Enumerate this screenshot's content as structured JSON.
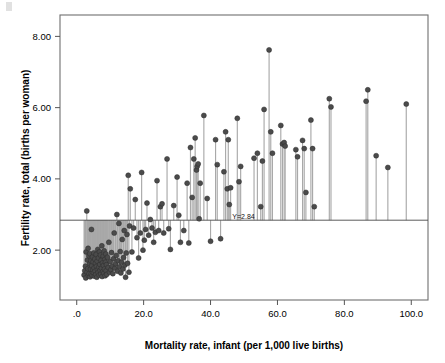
{
  "chart_data": {
    "type": "scatter",
    "title": "",
    "subtitle": "",
    "xlabel": "Mortality rate, infant (per 1,000 live births)",
    "ylabel": "Fertility rate, total (births per woman)",
    "xlim": [
      -5.0,
      105.0
    ],
    "ylim": [
      0.6,
      8.6
    ],
    "xticks": [
      0,
      20,
      40,
      60,
      80,
      100
    ],
    "xticklabels": [
      ".0",
      "20.0",
      "40.0",
      "60.0",
      "80.0",
      "100.0"
    ],
    "yticks": [
      2,
      4,
      6,
      8
    ],
    "yticklabels": [
      "2.00",
      "4.00",
      "6.00",
      "8.00"
    ],
    "grid": false,
    "legend": null,
    "legend_position": "none",
    "marker_style": "filled-circle",
    "marker_color": "#4b4b4b",
    "dropline_color": "#a9a9a9",
    "frame_color": "#6f6f6f",
    "annotations": [
      {
        "name": "reference-line-label",
        "text": "Y=2.84",
        "x": 46.5,
        "y": 2.84
      }
    ],
    "reference_lines": [
      {
        "name": "mean-fertility-reference-line",
        "orientation": "horizontal",
        "value": 2.84,
        "label": "Y=2.84"
      }
    ],
    "droplines_to": 2.84,
    "n_points": 189,
    "points": [
      [
        2.2,
        1.3
      ],
      [
        2.4,
        1.42
      ],
      [
        2.6,
        1.55
      ],
      [
        2.7,
        1.22
      ],
      [
        2.8,
        1.95
      ],
      [
        3.0,
        3.1
      ],
      [
        3.1,
        1.38
      ],
      [
        3.2,
        1.72
      ],
      [
        3.3,
        1.48
      ],
      [
        3.4,
        2.05
      ],
      [
        3.5,
        1.28
      ],
      [
        3.6,
        1.84
      ],
      [
        3.7,
        1.34
      ],
      [
        3.8,
        1.62
      ],
      [
        3.9,
        1.9
      ],
      [
        4.0,
        1.25
      ],
      [
        4.1,
        1.47
      ],
      [
        4.2,
        1.7
      ],
      [
        4.3,
        1.33
      ],
      [
        4.4,
        2.58
      ],
      [
        4.5,
        1.56
      ],
      [
        4.6,
        1.29
      ],
      [
        4.7,
        1.81
      ],
      [
        4.8,
        1.44
      ],
      [
        4.9,
        1.67
      ],
      [
        5.0,
        1.36
      ],
      [
        5.1,
        1.92
      ],
      [
        5.2,
        1.5
      ],
      [
        5.3,
        1.27
      ],
      [
        5.4,
        1.75
      ],
      [
        5.5,
        1.41
      ],
      [
        5.6,
        1.63
      ],
      [
        5.7,
        1.31
      ],
      [
        5.8,
        1.88
      ],
      [
        5.9,
        1.54
      ],
      [
        6.0,
        1.24
      ],
      [
        6.1,
        1.69
      ],
      [
        6.2,
        1.45
      ],
      [
        6.3,
        2.02
      ],
      [
        6.4,
        1.37
      ],
      [
        6.5,
        1.78
      ],
      [
        6.6,
        1.52
      ],
      [
        6.7,
        1.3
      ],
      [
        6.8,
        1.95
      ],
      [
        6.9,
        1.6
      ],
      [
        7.0,
        1.43
      ],
      [
        7.1,
        1.86
      ],
      [
        7.2,
        1.33
      ],
      [
        7.3,
        1.71
      ],
      [
        7.4,
        1.49
      ],
      [
        7.5,
        2.12
      ],
      [
        7.6,
        1.26
      ],
      [
        7.7,
        1.64
      ],
      [
        7.8,
        1.4
      ],
      [
        7.9,
        1.83
      ],
      [
        8.0,
        1.57
      ],
      [
        8.1,
        1.35
      ],
      [
        8.2,
        1.98
      ],
      [
        8.3,
        1.47
      ],
      [
        8.4,
        1.74
      ],
      [
        8.5,
        1.28
      ],
      [
        8.6,
        1.66
      ],
      [
        8.7,
        1.89
      ],
      [
        8.8,
        1.42
      ],
      [
        8.9,
        1.59
      ],
      [
        9.0,
        1.32
      ],
      [
        9.2,
        1.8
      ],
      [
        9.4,
        1.51
      ],
      [
        9.6,
        2.22
      ],
      [
        9.8,
        1.38
      ],
      [
        10.0,
        1.68
      ],
      [
        10.2,
        1.45
      ],
      [
        10.4,
        1.93
      ],
      [
        10.6,
        1.55
      ],
      [
        10.8,
        1.34
      ],
      [
        11.0,
        1.76
      ],
      [
        11.2,
        2.48
      ],
      [
        11.4,
        1.49
      ],
      [
        11.6,
        1.62
      ],
      [
        11.8,
        1.85
      ],
      [
        12.0,
        3.0
      ],
      [
        12.2,
        1.41
      ],
      [
        12.4,
        1.7
      ],
      [
        12.6,
        2.75
      ],
      [
        12.8,
        1.53
      ],
      [
        13.0,
        1.96
      ],
      [
        13.2,
        1.36
      ],
      [
        13.4,
        1.66
      ],
      [
        13.6,
        2.3
      ],
      [
        13.8,
        1.47
      ],
      [
        14.0,
        1.79
      ],
      [
        14.2,
        2.55
      ],
      [
        14.4,
        1.58
      ],
      [
        14.6,
        1.24
      ],
      [
        14.8,
        1.92
      ],
      [
        15.0,
        2.44
      ],
      [
        15.2,
        1.63
      ],
      [
        15.4,
        4.1
      ],
      [
        15.6,
        1.38
      ],
      [
        15.8,
        2.68
      ],
      [
        16.0,
        3.72
      ],
      [
        16.5,
        1.95
      ],
      [
        17.0,
        2.62
      ],
      [
        17.5,
        3.42
      ],
      [
        18.0,
        2.35
      ],
      [
        18.5,
        1.78
      ],
      [
        19.0,
        2.48
      ],
      [
        19.4,
        4.18
      ],
      [
        19.8,
        2.0
      ],
      [
        20.2,
        2.28
      ],
      [
        20.6,
        2.58
      ],
      [
        21.0,
        3.32
      ],
      [
        21.5,
        2.42
      ],
      [
        22.0,
        2.86
      ],
      [
        22.5,
        2.62
      ],
      [
        23.0,
        2.22
      ],
      [
        23.5,
        2.5
      ],
      [
        24.0,
        3.95
      ],
      [
        24.5,
        2.55
      ],
      [
        25.0,
        3.22
      ],
      [
        25.5,
        3.3
      ],
      [
        26.0,
        2.48
      ],
      [
        27.0,
        4.56
      ],
      [
        27.5,
        2.6
      ],
      [
        28.0,
        2.02
      ],
      [
        29.0,
        3.25
      ],
      [
        30.0,
        4.05
      ],
      [
        30.5,
        2.98
      ],
      [
        31.0,
        2.22
      ],
      [
        32.0,
        2.55
      ],
      [
        33.0,
        3.88
      ],
      [
        33.5,
        2.2
      ],
      [
        34.0,
        4.88
      ],
      [
        34.5,
        3.48
      ],
      [
        35.0,
        4.56
      ],
      [
        35.4,
        5.15
      ],
      [
        35.8,
        4.25
      ],
      [
        36.0,
        4.35
      ],
      [
        36.3,
        4.42
      ],
      [
        36.6,
        2.88
      ],
      [
        36.9,
        3.88
      ],
      [
        38.0,
        5.78
      ],
      [
        39.0,
        3.45
      ],
      [
        40.0,
        2.25
      ],
      [
        41.5,
        5.1
      ],
      [
        42.0,
        4.4
      ],
      [
        43.0,
        2.32
      ],
      [
        44.0,
        4.2
      ],
      [
        44.5,
        5.32
      ],
      [
        45.0,
        3.72
      ],
      [
        45.3,
        5.1
      ],
      [
        45.6,
        3.28
      ],
      [
        46.0,
        3.75
      ],
      [
        48.0,
        5.7
      ],
      [
        48.5,
        3.92
      ],
      [
        49.0,
        4.35
      ],
      [
        53.0,
        4.58
      ],
      [
        54.0,
        4.72
      ],
      [
        55.0,
        3.22
      ],
      [
        55.5,
        4.5
      ],
      [
        56.0,
        5.95
      ],
      [
        57.5,
        7.62
      ],
      [
        58.0,
        5.32
      ],
      [
        58.5,
        4.72
      ],
      [
        61.0,
        5.5
      ],
      [
        61.5,
        4.98
      ],
      [
        62.0,
        5.02
      ],
      [
        62.3,
        4.92
      ],
      [
        65.5,
        4.82
      ],
      [
        66.0,
        4.62
      ],
      [
        67.5,
        5.08
      ],
      [
        68.0,
        4.85
      ],
      [
        68.5,
        3.62
      ],
      [
        70.0,
        5.65
      ],
      [
        70.5,
        4.85
      ],
      [
        71.0,
        3.22
      ],
      [
        75.5,
        6.25
      ],
      [
        76.0,
        6.02
      ],
      [
        86.5,
        6.18
      ],
      [
        87.0,
        6.5
      ],
      [
        89.5,
        4.65
      ],
      [
        93.0,
        4.32
      ],
      [
        98.5,
        6.1
      ]
    ]
  },
  "plot_area": {
    "left_px": 60,
    "right_px": 428,
    "top_px": 15,
    "bottom_px": 300
  }
}
